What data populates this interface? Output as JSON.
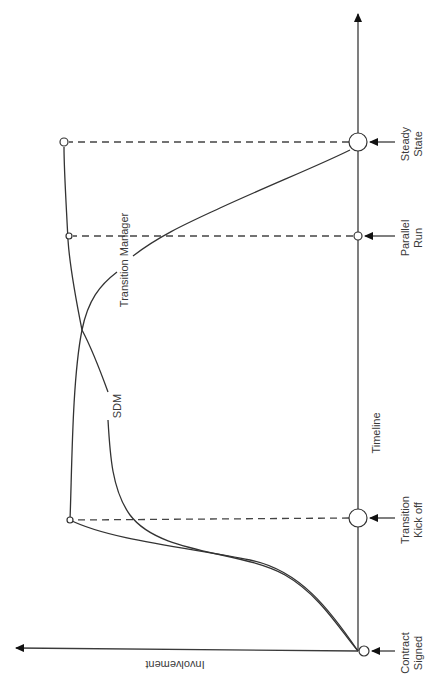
{
  "diagram": {
    "orientation": "rotated 90 degrees clockwise",
    "axes": {
      "timeline_label": "Timeline",
      "involvement_label": "Involvement"
    },
    "milestones": [
      {
        "id": "contract-signed",
        "line1": "Contract",
        "line2": "Signed"
      },
      {
        "id": "transition-kickoff",
        "line1": "Transition",
        "line2": "Kick off"
      },
      {
        "id": "parallel-run",
        "line1": "Parallel",
        "line2": "Run"
      },
      {
        "id": "steady-state",
        "line1": "Steady",
        "line2": "State"
      }
    ],
    "curves": [
      {
        "id": "sdm",
        "label": "SDM",
        "description": "Rises from zero at Contract Signed to maximum at Steady State"
      },
      {
        "id": "transition-manager",
        "label": "Transition Manager",
        "description": "Rises to maximum at Transition Kick off, then declines to zero at Steady State"
      }
    ],
    "colors": {
      "line": "#333333",
      "background": "#ffffff"
    }
  }
}
